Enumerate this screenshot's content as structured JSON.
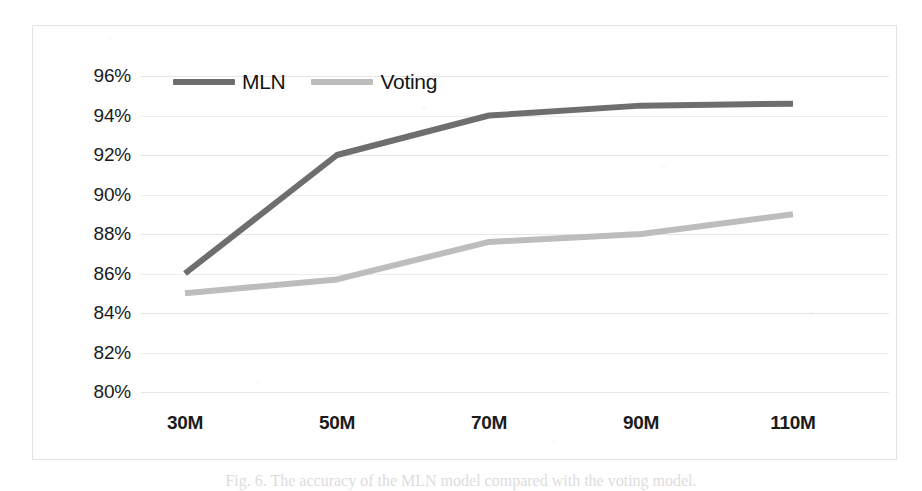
{
  "figure": {
    "caption": "Fig. 6. The accuracy of the MLN model compared with the voting model."
  },
  "legend": {
    "position": "top-left-inside",
    "entries": [
      {
        "label": "MLN",
        "color": "#6e6e6e",
        "swatch_name": "legend-swatch-mln"
      },
      {
        "label": "Voting",
        "color": "#bdbdbd",
        "swatch_name": "legend-swatch-voting"
      }
    ]
  },
  "axes": {
    "y_ticks": [
      "96%",
      "94%",
      "92%",
      "90%",
      "88%",
      "86%",
      "84%",
      "82%",
      "80%"
    ],
    "x_ticks": [
      "30M",
      "50M",
      "70M",
      "90M",
      "110M"
    ]
  },
  "chart_data": {
    "type": "line",
    "title": "",
    "xlabel": "",
    "ylabel": "",
    "categories": [
      "30M",
      "50M",
      "70M",
      "90M",
      "110M"
    ],
    "x_tick_labels": [
      "30M",
      "50M",
      "70M",
      "90M",
      "110M"
    ],
    "y_tick_labels": [
      "80%",
      "82%",
      "84%",
      "86%",
      "88%",
      "90%",
      "92%",
      "94%",
      "96%"
    ],
    "ylim": [
      80,
      96
    ],
    "y_tick_step": 2,
    "y_unit": "%",
    "grid": true,
    "grid_axis": "y",
    "legend_position": "top-left",
    "series": [
      {
        "name": "MLN",
        "color": "#6e6e6e",
        "values": [
          86.0,
          92.0,
          94.0,
          94.5,
          94.6
        ]
      },
      {
        "name": "Voting",
        "color": "#bdbdbd",
        "values": [
          85.0,
          85.7,
          87.6,
          88.0,
          89.0
        ]
      }
    ]
  }
}
